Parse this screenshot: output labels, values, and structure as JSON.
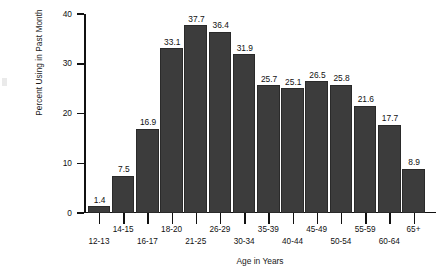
{
  "chart_data": {
    "type": "bar",
    "title": "",
    "xlabel": "Age in Years",
    "ylabel": "Percent Using in Past Month",
    "categories": [
      "12-13",
      "14-15",
      "16-17",
      "18-20",
      "21-25",
      "26-29",
      "30-34",
      "35-39",
      "40-44",
      "45-49",
      "50-54",
      "55-59",
      "60-64",
      "65+"
    ],
    "values": [
      1.4,
      7.5,
      16.9,
      33.1,
      37.7,
      36.4,
      31.9,
      25.7,
      25.1,
      26.5,
      25.8,
      21.6,
      17.7,
      8.9
    ],
    "value_labels": [
      "1.4",
      "7.5",
      "16.9",
      "33.1",
      "37.7",
      "36.4",
      "31.9",
      "25.7",
      "25.1",
      "26.5",
      "25.8",
      "21.6",
      "17.7",
      "8.9"
    ],
    "ylim": [
      0,
      40
    ],
    "ytick_labels": [
      "0",
      "10",
      "20",
      "30",
      "40"
    ],
    "ytick_values": [
      0,
      10,
      20,
      30,
      40
    ],
    "grid": false,
    "legend": "none",
    "bar_color": "#3c3c3c",
    "axis_color": "#111111",
    "background_color": "#ffffff",
    "xtick_label_rows": [
      "b",
      "a",
      "b",
      "a",
      "b",
      "a",
      "b",
      "a",
      "b",
      "a",
      "b",
      "a",
      "b",
      "a"
    ]
  }
}
